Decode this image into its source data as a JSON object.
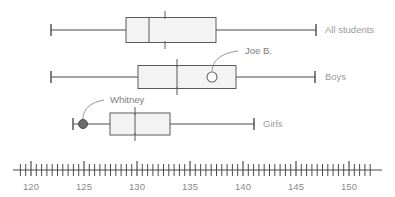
{
  "chart_data": {
    "type": "box",
    "title": "",
    "xlabel": "",
    "ylabel": "",
    "xlim": [
      118.5,
      152.5
    ],
    "grid": false,
    "legend_position": "right",
    "axis": {
      "major_ticks": [
        120,
        125,
        130,
        135,
        140,
        145,
        150
      ],
      "major_tick_labels": [
        "120",
        "125",
        "130",
        "135",
        "140",
        "145",
        "150"
      ],
      "minor_tick_step": 0.5,
      "minor_ticks_start": 119,
      "minor_ticks_end": 152
    },
    "categories": [
      "All students",
      "Boys",
      "Girls"
    ],
    "series": [
      {
        "name": "All students",
        "min": 122,
        "q1": 129,
        "median": 131.2,
        "q3": 137.5,
        "max": 146.8,
        "mean": 132.7
      },
      {
        "name": "Boys",
        "min": 122,
        "q1": 130.2,
        "median": 133.5,
        "q3": 139.3,
        "max": 146.7,
        "mean": 133.5
      },
      {
        "name": "Girls",
        "min": 124,
        "q1": 127.5,
        "median": 130,
        "q3": 133.2,
        "max": 141,
        "mean": 130
      }
    ],
    "annotations": [
      {
        "label": "Joe B.",
        "value": 136.8,
        "series": "Boys",
        "marker": "open-circle"
      },
      {
        "label": "Whitney",
        "value": 125,
        "series": "Girls",
        "marker": "filled-circle"
      }
    ]
  },
  "labels": {
    "all_students": "All students",
    "boys": "Boys",
    "girls": "Girls"
  },
  "annotation_labels": {
    "joe": "Joe B.",
    "whitney": "Whitney"
  },
  "ticks": {
    "t120": "120",
    "t125": "125",
    "t130": "130",
    "t135": "135",
    "t140": "140",
    "t145": "145",
    "t150": "150"
  },
  "colors": {
    "box_fill": "#f3f3f3",
    "stroke": "#5a5a5a",
    "axis": "#4a4a4a",
    "label_text": "#9a9a9a",
    "annotation_text": "#7d7d7d",
    "marker_filled": "#6d6d6d"
  }
}
